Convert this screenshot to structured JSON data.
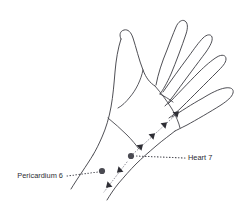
{
  "figure": {
    "background_color": "#ffffff",
    "line_color": "#3b3b42",
    "label_color": "#2c2c33",
    "dot_color": "#4a4a52",
    "arrow_color": "#2e2e35",
    "leader_color": "#4a4a52",
    "meridian_color": "#8f8f99"
  },
  "labels": {
    "pericardium": {
      "text": "Pericardium 6",
      "x": 63,
      "y": 178,
      "anchor": "end",
      "point_x": 102,
      "point_y": 171
    },
    "heart": {
      "text": "Heart 7",
      "x": 188,
      "y": 160,
      "anchor": "start",
      "point_x": 131,
      "point_y": 156
    }
  },
  "points": [
    {
      "name": "pericardium-6-point",
      "label": "Pericardium 6",
      "cx": 102,
      "cy": 171,
      "r": 3.1
    },
    {
      "name": "heart-7-point",
      "label": "Heart 7",
      "cx": 131,
      "cy": 156,
      "r": 3.1
    }
  ],
  "leaders": [
    {
      "name": "pericardium-6-leader",
      "from_x": 67,
      "from_y": 176,
      "to_x": 98,
      "to_y": 172
    },
    {
      "name": "heart-7-leader",
      "from_x": 185,
      "from_y": 158,
      "to_x": 136,
      "to_y": 156
    }
  ],
  "arrow_trail_up": {
    "name": "heart-meridian-trail",
    "description": "dotted arrow trail running proximal-to-distal along the ulnar wrist toward the little finger",
    "arrows": [
      {
        "x": 139,
        "y": 148,
        "angle": -43
      },
      {
        "x": 151,
        "y": 137,
        "angle": -43
      },
      {
        "x": 163,
        "y": 126,
        "angle": -43
      },
      {
        "x": 175,
        "y": 115,
        "angle": -43
      }
    ]
  },
  "arrow_trail_down": {
    "name": "pericardium-meridian-trail",
    "description": "dotted arrow trail running distal-to-proximal down the forearm",
    "arrows": [
      {
        "x": 121,
        "y": 169,
        "angle": 137
      },
      {
        "x": 110,
        "y": 184,
        "angle": 137
      }
    ]
  },
  "icons": {
    "point_marker": "filled-circle-marker",
    "arrow_marker": "solid-triangle-arrow",
    "leader": "dotted-leader-line"
  }
}
